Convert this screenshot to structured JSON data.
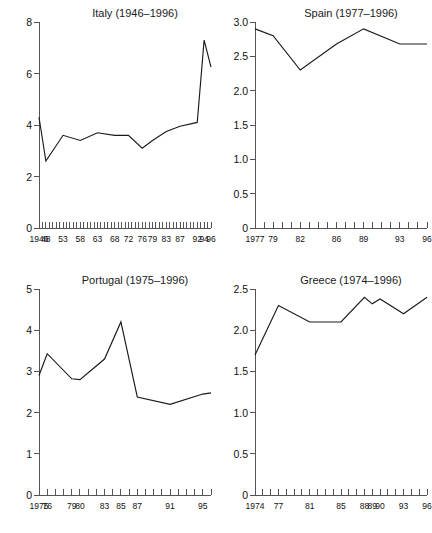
{
  "figure": {
    "background": "#ffffff",
    "line_color": "#1a1a1a",
    "axis_color": "#555555"
  },
  "chart_data": [
    {
      "type": "line",
      "panel": "top-left",
      "title": "Italy (1946–1996)",
      "xlabel": "",
      "ylabel": "",
      "xlim": [
        1946,
        1996
      ],
      "ylim": [
        0,
        8
      ],
      "yticks": [
        0,
        2,
        4,
        6,
        8
      ],
      "ytick_labels": [
        "0",
        "2",
        "4",
        "6",
        "8"
      ],
      "xticks": [
        1946,
        1948,
        1953,
        1958,
        1963,
        1968,
        1972,
        1976,
        1979,
        1983,
        1987,
        1992,
        1994,
        1996
      ],
      "xtick_labels": [
        "1946",
        "48",
        "53",
        "58",
        "63",
        "68",
        "72",
        "76",
        "79",
        "83",
        "87",
        "92",
        "94",
        "96"
      ],
      "minor_tick_step": 1,
      "grid": false,
      "legend": null,
      "x": [
        1946,
        1948,
        1953,
        1958,
        1963,
        1968,
        1972,
        1976,
        1979,
        1983,
        1987,
        1992,
        1994,
        1996
      ],
      "values": [
        4.3,
        2.6,
        3.6,
        3.4,
        3.7,
        3.6,
        3.6,
        3.1,
        3.4,
        3.75,
        3.95,
        4.1,
        7.3,
        6.25
      ]
    },
    {
      "type": "line",
      "panel": "top-right",
      "title": "Spain (1977–1996)",
      "xlabel": "",
      "ylabel": "",
      "xlim": [
        1977,
        1996
      ],
      "ylim": [
        0,
        3.0
      ],
      "yticks": [
        0,
        0.5,
        1.0,
        1.5,
        2.0,
        2.5,
        3.0
      ],
      "ytick_labels": [
        "0",
        "0.5",
        "1.0",
        "1.5",
        "2.0",
        "2.5",
        "3.0"
      ],
      "xticks": [
        1977,
        1979,
        1982,
        1986,
        1989,
        1993,
        1996
      ],
      "xtick_labels": [
        "1977",
        "79",
        "82",
        "86",
        "89",
        "93",
        "96"
      ],
      "minor_tick_step": 1,
      "grid": false,
      "legend": null,
      "x": [
        1977,
        1979,
        1982,
        1986,
        1989,
        1993,
        1996
      ],
      "values": [
        2.9,
        2.8,
        2.3,
        2.68,
        2.9,
        2.68,
        2.68
      ]
    },
    {
      "type": "line",
      "panel": "bottom-left",
      "title": "Portugal (1975–1996)",
      "xlabel": "",
      "ylabel": "",
      "xlim": [
        1975,
        1996
      ],
      "ylim": [
        0,
        5
      ],
      "yticks": [
        0,
        1,
        2,
        3,
        4,
        5
      ],
      "ytick_labels": [
        "0",
        "1",
        "2",
        "3",
        "4",
        "5"
      ],
      "xticks": [
        1975,
        1976,
        1979,
        1980,
        1983,
        1985,
        1987,
        1991,
        1995
      ],
      "xtick_labels": [
        "1975",
        "76",
        "79",
        "80",
        "83",
        "85",
        "87",
        "91",
        "95"
      ],
      "minor_tick_step": 1,
      "grid": false,
      "legend": null,
      "x": [
        1975,
        1976,
        1979,
        1980,
        1983,
        1985,
        1987,
        1991,
        1995,
        1996
      ],
      "values": [
        2.9,
        3.43,
        2.82,
        2.8,
        3.3,
        4.2,
        2.38,
        2.2,
        2.45,
        2.48
      ]
    },
    {
      "type": "line",
      "panel": "bottom-right",
      "title": "Greece (1974–1996)",
      "xlabel": "",
      "ylabel": "",
      "xlim": [
        1974,
        1996
      ],
      "ylim": [
        0,
        2.5
      ],
      "yticks": [
        0,
        0.5,
        1.0,
        1.5,
        2.0,
        2.5
      ],
      "ytick_labels": [
        "0",
        "0.5",
        "1.0",
        "1.5",
        "2.0",
        "2.5"
      ],
      "xticks": [
        1974,
        1977,
        1981,
        1985,
        1988,
        1989,
        1990,
        1993,
        1996
      ],
      "xtick_labels": [
        "1974",
        "77",
        "81",
        "85",
        "88",
        "89",
        "90",
        "93",
        "96"
      ],
      "minor_tick_step": 1,
      "grid": false,
      "legend": null,
      "x": [
        1974,
        1977,
        1981,
        1985,
        1988,
        1989,
        1990,
        1993,
        1996
      ],
      "values": [
        1.7,
        2.3,
        2.1,
        2.1,
        2.4,
        2.32,
        2.38,
        2.2,
        2.4
      ]
    }
  ]
}
